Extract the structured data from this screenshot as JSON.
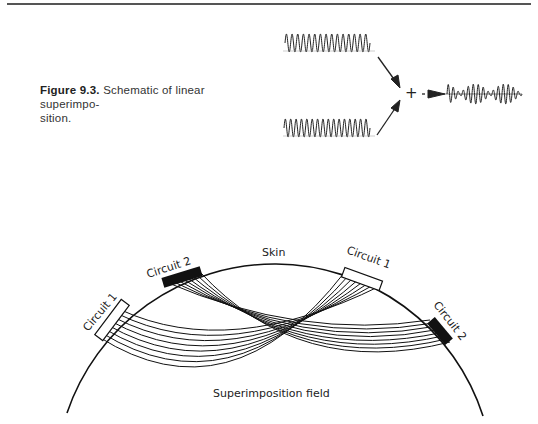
{
  "caption": {
    "label": "Figure 9.3.",
    "text": "Schematic of linear superimpo-",
    "text2": "sition."
  },
  "top_figure": {
    "plus_sign": "+",
    "waves": [
      "input-wave-1",
      "input-wave-2",
      "superimposed-output-wave"
    ]
  },
  "bottom_figure": {
    "skin_label": "Skin",
    "circuit_left_1": "Circuit 1",
    "circuit_left_2": "Circuit 2",
    "circuit_right_1": "Circuit 1",
    "circuit_right_2": "Circuit 2",
    "field_label": "Superimposition field"
  }
}
